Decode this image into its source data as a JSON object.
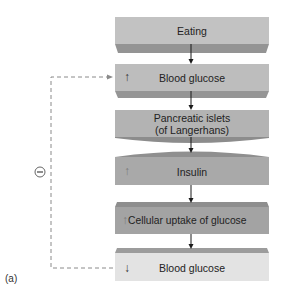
{
  "diagram": {
    "panel_label": "(a)",
    "feedback": {
      "symbol": "−",
      "meaning": "negative feedback",
      "line_style": "dashed"
    },
    "steps": [
      {
        "id": "eating",
        "text": "Eating",
        "indicator": ""
      },
      {
        "id": "blood-glucose-up",
        "text": "Blood glucose",
        "indicator": "↑"
      },
      {
        "id": "pancreatic-islets",
        "text": "Pancreatic islets",
        "text2": "(of Langerhans)",
        "indicator": ""
      },
      {
        "id": "insulin-up",
        "text": "Insulin",
        "indicator": "↑"
      },
      {
        "id": "cellular-uptake-up",
        "text": "Cellular uptake of glucose",
        "indicator": "↑"
      },
      {
        "id": "blood-glucose-down",
        "text": "Blood glucose",
        "indicator": "↓"
      }
    ],
    "colors": {
      "box_face": "#bcbcbc",
      "box_face_dark": "#a9a9a9",
      "box_bevel": "#8f8f8f",
      "box_light": "#e4e4e4",
      "dashed_line": "#8a8a8a",
      "arrow": "#1a1a1a"
    }
  }
}
